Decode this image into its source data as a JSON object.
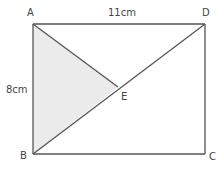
{
  "diagram": {
    "type": "geometry-figure",
    "shape": "rectangle ABCD with diagonals AC-fragment and BD, shaded triangle ABE",
    "points": {
      "A": "A",
      "B": "B",
      "C": "C",
      "D": "D",
      "E": "E"
    },
    "measurements": {
      "top_side": "11cm",
      "left_side": "8cm"
    },
    "segments": [
      "AD",
      "DC",
      "CB",
      "BA",
      "AE",
      "BD"
    ],
    "shaded_region": "triangle ABE",
    "colors": {
      "line": "#555555",
      "shade": "#ebebeb",
      "text": "#444444"
    }
  }
}
